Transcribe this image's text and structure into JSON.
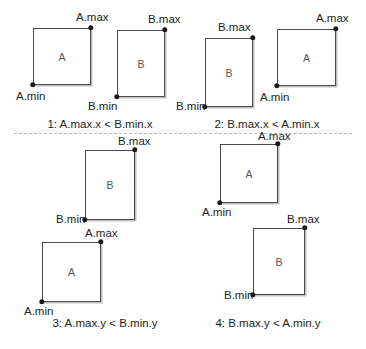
{
  "figure": {
    "width": 366,
    "height": 349,
    "background": "#ffffff",
    "stroke_color": "#4a4a4a",
    "dot_color": "#1a1a1a",
    "divider_color": "#b9b9b9",
    "letter_color": "#555555"
  },
  "labels": {
    "a_max": "A.max",
    "a_min": "A.min",
    "b_max": "B.max",
    "b_min": "B.min",
    "letter_a": "A",
    "letter_b": "B"
  },
  "cases": [
    {
      "id": "case-1",
      "caption": "1: A.max.x < B.min.x",
      "caption_x": 100,
      "caption_y": 119,
      "rects": [
        {
          "name": "A",
          "letter": "A",
          "x": 33,
          "y": 28,
          "w": 58,
          "h": 57,
          "min_label": "A.min",
          "min_label_x": 16,
          "min_label_y": 91,
          "max_label": "A.max",
          "max_label_x": 76,
          "max_label_y": 12
        },
        {
          "name": "B",
          "letter": "B",
          "x": 117,
          "y": 30,
          "w": 48,
          "h": 67,
          "min_label": "B.min",
          "min_label_x": 88,
          "min_label_y": 101,
          "max_label": "B.max",
          "max_label_x": 148,
          "max_label_y": 14
        }
      ]
    },
    {
      "id": "case-2",
      "caption": "2: B.max.x < A.min.x",
      "caption_x": 267,
      "caption_y": 119,
      "rects": [
        {
          "name": "B",
          "letter": "B",
          "x": 205,
          "y": 38,
          "w": 48,
          "h": 69,
          "min_label": "B.min",
          "min_label_x": 176,
          "min_label_y": 101,
          "max_label": "B.max",
          "max_label_x": 218,
          "max_label_y": 22
        },
        {
          "name": "A",
          "letter": "A",
          "x": 277,
          "y": 29,
          "w": 59,
          "h": 57,
          "min_label": "A.min",
          "min_label_x": 260,
          "min_label_y": 92,
          "max_label": "A.max",
          "max_label_x": 316,
          "max_label_y": 13
        }
      ]
    },
    {
      "id": "case-3",
      "caption": "3: A.max.y < B.min.y",
      "caption_x": 105,
      "caption_y": 318,
      "rects": [
        {
          "name": "B",
          "letter": "B",
          "x": 85,
          "y": 150,
          "w": 50,
          "h": 70,
          "min_label": "B.min",
          "min_label_x": 56,
          "min_label_y": 219,
          "max_label": "B.max",
          "max_label_x": 118,
          "max_label_y": 136
        },
        {
          "name": "A",
          "letter": "A",
          "x": 42,
          "y": 242,
          "w": 59,
          "h": 60,
          "min_label": "A.min",
          "min_label_x": 24,
          "min_label_y": 308,
          "max_label": "A.max",
          "max_label_x": 85,
          "max_label_y": 229
        }
      ]
    },
    {
      "id": "case-4",
      "caption": "4: B.max.y < A.min.y",
      "caption_x": 268,
      "caption_y": 318,
      "rects": [
        {
          "name": "A",
          "letter": "A",
          "x": 220,
          "y": 144,
          "w": 58,
          "h": 59,
          "min_label": "A.min",
          "min_label_x": 202,
          "min_label_y": 209,
          "max_label": "A.max",
          "max_label_x": 258,
          "max_label_y": 135
        },
        {
          "name": "B",
          "letter": "B",
          "x": 253,
          "y": 228,
          "w": 52,
          "h": 67,
          "min_label": "B.min",
          "min_label_x": 224,
          "min_label_y": 296,
          "max_label": "B.max",
          "max_label_x": 287,
          "max_label_y": 216
        }
      ]
    }
  ],
  "divider": {
    "x": 14,
    "y": 133,
    "width": 338
  },
  "footnote": {
    "text": ""
  }
}
